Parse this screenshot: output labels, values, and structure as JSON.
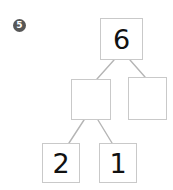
{
  "question": {
    "badge_label": "5"
  },
  "diagram": {
    "type": "number-bond-tree",
    "nodes": [
      {
        "id": "top",
        "label": "6",
        "empty": false
      },
      {
        "id": "mid-l",
        "label": "",
        "empty": true
      },
      {
        "id": "mid-r",
        "label": "",
        "empty": true
      },
      {
        "id": "bot-l",
        "label": "2",
        "empty": false
      },
      {
        "id": "bot-r",
        "label": "1",
        "empty": false
      }
    ],
    "colors": {
      "box_border": "#c9c9c9",
      "connector": "#b5b5b5",
      "numeral": "#111111",
      "badge_fill": "#575757",
      "badge_text": "#ffffff",
      "background": "#ffffff"
    }
  }
}
